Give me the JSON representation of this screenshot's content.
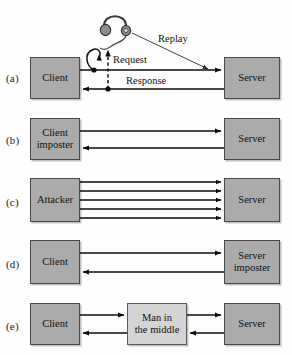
{
  "figure": {
    "background_color": "#fefefe",
    "box_fill_color": "#ababab",
    "box_fill_light_color": "#d4d4d4",
    "box_border_color": "#4a4a4a",
    "line_color": "#0d0d0d"
  },
  "rows": [
    {
      "label": "(a)",
      "scenario": "replay-attack",
      "left_node": "Client",
      "right_node": "Server",
      "edge_labels": [
        "Request",
        "Response",
        "Replay"
      ],
      "eavesdropper_icon": "headphones-icon"
    },
    {
      "label": "(b)",
      "scenario": "client-imposter",
      "left_node_line1": "Client",
      "left_node_line2": "imposter",
      "right_node": "Server",
      "arrow_count": 2
    },
    {
      "label": "(c)",
      "scenario": "flood-attack",
      "left_node": "Attacker",
      "right_node": "Server",
      "arrow_count": 5
    },
    {
      "label": "(d)",
      "scenario": "server-imposter",
      "left_node": "Client",
      "right_node_line1": "Server",
      "right_node_line2": "imposter",
      "arrow_count": 2
    },
    {
      "label": "(e)",
      "scenario": "man-in-the-middle",
      "left_node": "Client",
      "middle_node_line1": "Man in",
      "middle_node_line2": "the middle",
      "right_node": "Server",
      "arrow_count": 4
    }
  ],
  "labels": {
    "a": "(a)",
    "b": "(b)",
    "c": "(c)",
    "d": "(d)",
    "e": "(e)",
    "client": "Client",
    "server": "Server",
    "attacker": "Attacker",
    "client_line1": "Client",
    "imposter_line2": "imposter",
    "server_line1": "Server",
    "mitm_line1": "Man in",
    "mitm_line2": "the middle",
    "request": "Request",
    "response": "Response",
    "replay": "Replay"
  }
}
